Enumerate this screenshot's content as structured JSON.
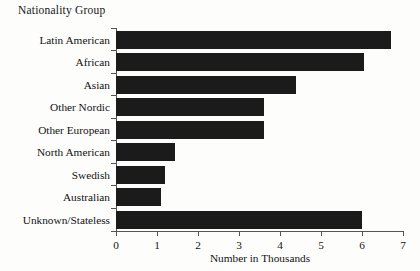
{
  "chart_data": {
    "type": "bar",
    "orientation": "horizontal",
    "title": "Nationality Group",
    "xlabel": "Number in Thousands",
    "ylabel": "Nationality Group",
    "xlim": [
      0,
      7
    ],
    "xticks": [
      0,
      1,
      2,
      3,
      4,
      5,
      6,
      7
    ],
    "xticklabels": [
      "0",
      "1",
      "2",
      "3",
      "4",
      "5",
      "6",
      "7"
    ],
    "grid": false,
    "legend": null,
    "bar_color": "#1b1b1b",
    "background_color": "#fdfdfc",
    "axis_color": "#55544f",
    "categories": [
      "Latin American",
      "African",
      "Asian",
      "Other Nordic",
      "Other European",
      "North American",
      "Swedish",
      "Australian",
      "Unknown/Stateless"
    ],
    "values": [
      6.7,
      6.05,
      4.4,
      3.6,
      3.6,
      1.45,
      1.2,
      1.1,
      6.0
    ]
  }
}
